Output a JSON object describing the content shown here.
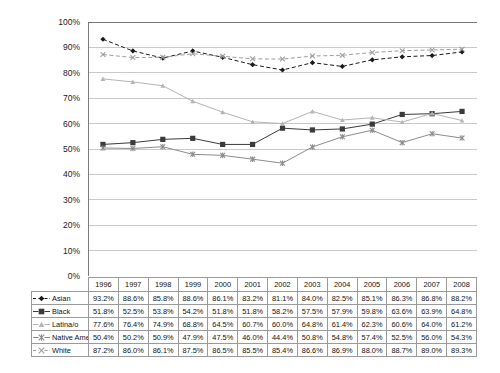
{
  "chart_data": {
    "type": "line",
    "title": "",
    "subtitle": "",
    "xlabel": "",
    "ylabel": "",
    "ylim": [
      0,
      100
    ],
    "y_ticks": [
      "0%",
      "10%",
      "20%",
      "30%",
      "40%",
      "50%",
      "60%",
      "70%",
      "80%",
      "90%",
      "100%"
    ],
    "grid": "horizontal",
    "legend_position": "row-labels-in-table",
    "categories": [
      "1996",
      "1997",
      "1998",
      "1999",
      "2000",
      "2001",
      "2002",
      "2003",
      "2004",
      "2005",
      "2006",
      "2007",
      "2008"
    ],
    "series": [
      {
        "name": "Asian",
        "marker": "diamond",
        "line_style": "dashed",
        "color": "#1a1a1a",
        "values": [
          93.2,
          88.6,
          85.8,
          88.6,
          86.1,
          83.2,
          81.1,
          84.0,
          82.5,
          85.1,
          86.3,
          86.8,
          88.2
        ],
        "labels": [
          "93.2%",
          "88.6%",
          "85.8%",
          "88.6%",
          "86.1%",
          "83.2%",
          "81.1%",
          "84.0%",
          "82.5%",
          "85.1%",
          "86.3%",
          "86.8%",
          "88.2%"
        ]
      },
      {
        "name": "Black",
        "marker": "square",
        "line_style": "solid",
        "color": "#3b3b3b",
        "values": [
          51.8,
          52.5,
          53.8,
          54.2,
          51.8,
          51.8,
          58.2,
          57.5,
          57.9,
          59.8,
          63.6,
          63.9,
          64.8
        ],
        "labels": [
          "51.8%",
          "52.5%",
          "53.8%",
          "54.2%",
          "51.8%",
          "51.8%",
          "58.2%",
          "57.5%",
          "57.9%",
          "59.8%",
          "63.6%",
          "63.9%",
          "64.8%"
        ]
      },
      {
        "name": "Latina/o",
        "marker": "triangle",
        "line_style": "solid",
        "color": "#b4b4b4",
        "values": [
          77.6,
          76.4,
          74.9,
          68.8,
          64.5,
          60.7,
          60.0,
          64.8,
          61.4,
          62.3,
          60.6,
          64.0,
          61.2
        ],
        "labels": [
          "77.6%",
          "76.4%",
          "74.9%",
          "68.8%",
          "64.5%",
          "60.7%",
          "60.0%",
          "64.8%",
          "61.4%",
          "62.3%",
          "60.6%",
          "64.0%",
          "61.2%"
        ]
      },
      {
        "name": "Native American",
        "marker": "asterisk",
        "line_style": "solid",
        "color": "#8c8c8c",
        "values": [
          50.4,
          50.2,
          50.9,
          47.9,
          47.5,
          46.0,
          44.4,
          50.8,
          54.8,
          57.4,
          52.5,
          56.0,
          54.3
        ],
        "labels": [
          "50.4%",
          "50.2%",
          "50.9%",
          "47.9%",
          "47.5%",
          "46.0%",
          "44.4%",
          "50.8%",
          "54.8%",
          "57.4%",
          "52.5%",
          "56.0%",
          "54.3%"
        ]
      },
      {
        "name": "White",
        "marker": "x",
        "line_style": "dashed",
        "color": "#9e9e9e",
        "values": [
          87.2,
          86.0,
          86.1,
          87.5,
          86.5,
          85.5,
          85.4,
          86.6,
          86.9,
          88.0,
          88.7,
          89.0,
          89.3
        ],
        "labels": [
          "87.2%",
          "86.0%",
          "86.1%",
          "87.5%",
          "86.5%",
          "85.5%",
          "85.4%",
          "86.6%",
          "86.9%",
          "88.0%",
          "88.7%",
          "89.0%",
          "89.3%"
        ]
      }
    ]
  },
  "table": {
    "corner_label": "",
    "column_headers": [
      "1996",
      "1997",
      "1998",
      "1999",
      "2000",
      "2001",
      "2002",
      "2003",
      "2004",
      "2005",
      "2006",
      "2007",
      "2008"
    ],
    "rows": [
      {
        "label": "Asian",
        "values": [
          "93.2%",
          "88.6%",
          "85.8%",
          "88.6%",
          "86.1%",
          "83.2%",
          "81.1%",
          "84.0%",
          "82.5%",
          "85.1%",
          "86.3%",
          "86.8%",
          "88.2%"
        ]
      },
      {
        "label": "Black",
        "values": [
          "51.8%",
          "52.5%",
          "53.8%",
          "54.2%",
          "51.8%",
          "51.8%",
          "58.2%",
          "57.5%",
          "57.9%",
          "59.8%",
          "63.6%",
          "63.9%",
          "64.8%"
        ]
      },
      {
        "label": "Latina/o",
        "values": [
          "77.6%",
          "76.4%",
          "74.9%",
          "68.8%",
          "64.5%",
          "60.7%",
          "60.0%",
          "64.8%",
          "61.4%",
          "62.3%",
          "60.6%",
          "64.0%",
          "61.2%"
        ]
      },
      {
        "label": "Native American",
        "values": [
          "50.4%",
          "50.2%",
          "50.9%",
          "47.9%",
          "47.5%",
          "46.0%",
          "44.4%",
          "50.8%",
          "54.8%",
          "57.4%",
          "52.5%",
          "56.0%",
          "54.3%"
        ]
      },
      {
        "label": "White",
        "values": [
          "87.2%",
          "86.0%",
          "86.1%",
          "87.5%",
          "86.5%",
          "85.5%",
          "85.4%",
          "86.6%",
          "86.9%",
          "88.0%",
          "88.7%",
          "89.0%",
          "89.3%"
        ]
      }
    ]
  },
  "axis": {
    "y_ticks": [
      "100%",
      "90%",
      "80%",
      "70%",
      "60%",
      "50%",
      "40%",
      "30%",
      "20%",
      "10%",
      "0%"
    ]
  },
  "colors": {
    "gridline": "#bdbdbd",
    "axis": "#6e6e6e",
    "table_border": "#9a9a9a",
    "background": "#ffffff"
  }
}
